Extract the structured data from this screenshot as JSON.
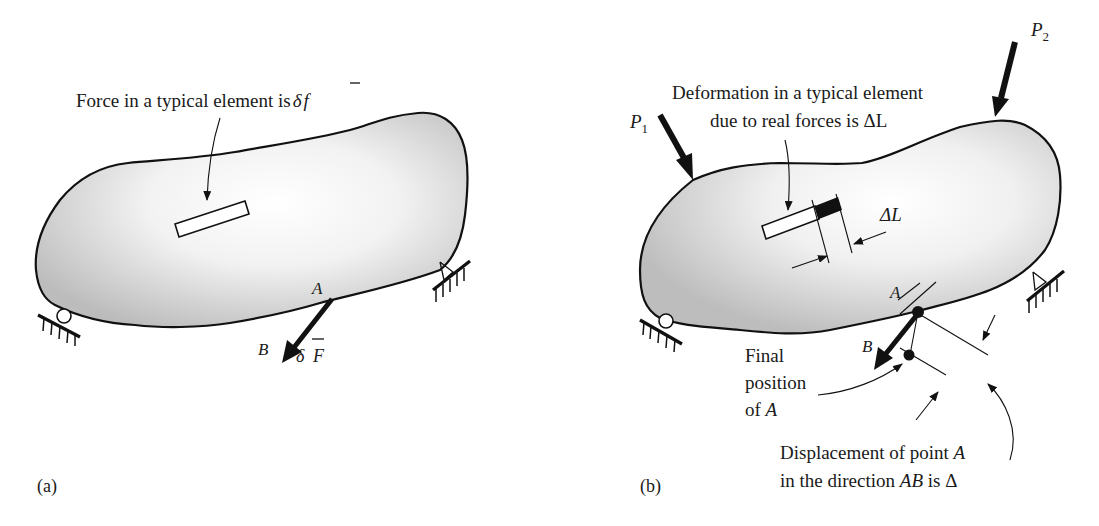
{
  "figure": {
    "panel_a": {
      "label": "(a)",
      "element_caption": "Force in a typical element is δf̄",
      "element_caption_text": "Force in a typical element is",
      "element_caption_symbol": "δ",
      "element_caption_var": "f",
      "point_a": "A",
      "point_b": "B",
      "force_symbol": "δ",
      "force_var": "F"
    },
    "panel_b": {
      "label": "(b)",
      "load_1": "P",
      "load_1_sub": "1",
      "load_2": "P",
      "load_2_sub": "2",
      "deformation_caption_line1": "Deformation in a typical element",
      "deformation_caption_line2": "due to real forces is  ΔL",
      "delta_l_label": "ΔL",
      "point_a": "A",
      "point_b": "B",
      "final_position_line1": "Final",
      "final_position_line2": "position",
      "final_position_line3_prefix": "of ",
      "final_position_line3_var": "A",
      "displacement_line1_prefix": "Displacement of point ",
      "displacement_line1_var": "A",
      "displacement_line2_prefix": "in the direction ",
      "displacement_line2_var": "AB",
      "displacement_line2_suffix": " is Δ"
    },
    "colors": {
      "ink": "#111111",
      "shade": "#c8c8c8",
      "background": "#ffffff"
    }
  }
}
